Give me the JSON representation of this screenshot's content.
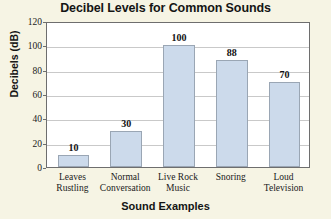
{
  "chart_data": {
    "type": "bar",
    "title": "Decibel Levels for Common Sounds",
    "xlabel": "Sound Examples",
    "ylabel": "Decibels (dB)",
    "categories": [
      "Leaves Rustling",
      "Normal Conversation",
      "Live Rock Music",
      "Snoring",
      "Loud Television"
    ],
    "category_lines": [
      [
        "Leaves",
        "Rustling"
      ],
      [
        "Normal",
        "Conversation"
      ],
      [
        "Live Rock",
        "Music"
      ],
      [
        "Snoring",
        ""
      ],
      [
        "Loud",
        "Television"
      ]
    ],
    "values": [
      10,
      30,
      100,
      88,
      70
    ],
    "value_labels": [
      "10",
      "30",
      "100",
      "88",
      "70"
    ],
    "ylim": [
      0,
      120
    ],
    "ytick_values": [
      0,
      20,
      40,
      60,
      80,
      100,
      120
    ],
    "ytick_labels": [
      "0",
      "20",
      "40",
      "60",
      "80",
      "100",
      "120"
    ],
    "grid": true,
    "legend": "none",
    "colors": {
      "bar_fill": "#ccdaeb",
      "bar_border": "#9aa6b4",
      "plot_background": "#ffffff",
      "page_background": "#f6f4e4",
      "gridline": "#c9c9c9",
      "axis": "#6e6e6e",
      "text": "#141414"
    }
  }
}
